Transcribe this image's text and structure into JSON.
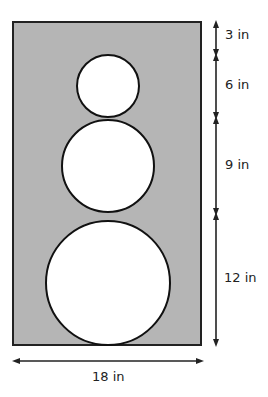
{
  "diagram": {
    "rectangle": {
      "fill": "#b5b5b5",
      "stroke": "#222222"
    },
    "circles": [
      {
        "name": "small-circle",
        "diameter_label": "6 in"
      },
      {
        "name": "middle-circle",
        "diameter_label": "9 in"
      },
      {
        "name": "large-circle",
        "diameter_label": "12 in"
      }
    ],
    "dimensions": {
      "top_gap": "3 in",
      "small": "6 in",
      "middle": "9 in",
      "large": "12 in",
      "width": "18 in"
    }
  }
}
